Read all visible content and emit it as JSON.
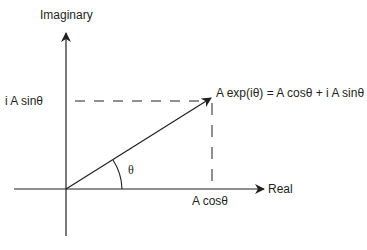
{
  "diagram": {
    "axes": {
      "imaginary_label": "Imaginary",
      "real_label": "Real"
    },
    "labels": {
      "imag_projection": "i A sinθ",
      "real_projection": "A cosθ",
      "vector_equation": "A exp(iθ) = A cosθ + i A sinθ",
      "angle": "θ"
    },
    "colors": {
      "stroke": "#231f20",
      "background": "#ffffff"
    }
  }
}
